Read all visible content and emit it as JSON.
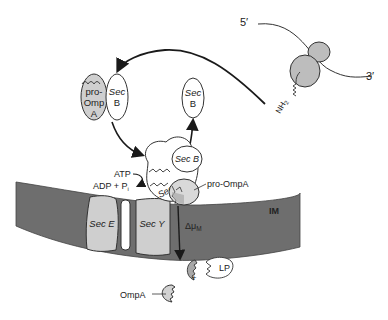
{
  "diagram": {
    "mrna": {
      "five_prime": "5′",
      "three_prime": "3′"
    },
    "ribosome": {
      "nascent_chain_label": "NH",
      "nascent_chain_sub": "2"
    },
    "complex_free": {
      "line1": "pro-",
      "line2": "Omp",
      "line3": "A",
      "chaperone_line1": "Sec",
      "chaperone_line2": "B"
    },
    "secb_released": {
      "line1": "Sec",
      "line2": "B"
    },
    "translocase": {
      "secb_label": "Sec B",
      "seca_label": "Sec A",
      "substrate_label": "pro-OmpA",
      "atp_label": "ATP",
      "adp_label": "ADP + P",
      "adp_sub": "i"
    },
    "membrane": {
      "label": "IM",
      "seca_channel": "Sec E",
      "secy_channel": "Sec Y",
      "pmf_label": "Δμ",
      "pmf_sub": "M"
    },
    "processing": {
      "leader_peptidase_label": "LP",
      "plus": "+",
      "product_label": "OmpA"
    },
    "colors": {
      "membrane": "#6e6e6e",
      "protein_fill": "#d2d2d2",
      "light_fill": "#ffffff",
      "stroke": "#2a2a2a"
    }
  }
}
